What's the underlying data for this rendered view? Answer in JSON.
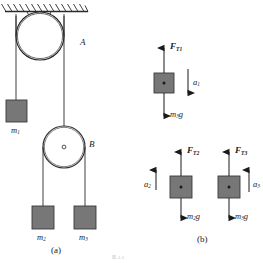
{
  "figure": {
    "panels": [
      {
        "key": "a",
        "caption": "(a)"
      },
      {
        "key": "b",
        "caption": "(b)"
      }
    ],
    "bottom_watermark": "图 4-4"
  },
  "panel_a": {
    "label_pulley_a": "A",
    "label_pulley_b": "B",
    "label_mass_1": "m",
    "label_mass_1_sub": "1",
    "label_mass_2": "m",
    "label_mass_2_sub": "2",
    "label_mass_3": "m",
    "label_mass_3_sub": "3",
    "caption": "(a)"
  },
  "panel_b": {
    "caption": "(b)",
    "bodies": [
      {
        "name": "fbd-m3-upper",
        "tension_symbol": "F",
        "tension_sub": "T1",
        "weight_symbol": "m",
        "weight_sub": "3",
        "weight_g": "g",
        "accel_symbol": "a",
        "accel_sub": "1",
        "accel_direction": "down"
      },
      {
        "name": "fbd-m2",
        "tension_symbol": "F",
        "tension_sub": "T2",
        "weight_symbol": "m",
        "weight_sub": "2",
        "weight_g": "g",
        "accel_symbol": "a",
        "accel_sub": "2",
        "accel_direction": "up"
      },
      {
        "name": "fbd-m3-lower",
        "tension_symbol": "F",
        "tension_sub": "T3",
        "weight_symbol": "m",
        "weight_sub": "3",
        "weight_g": "g",
        "accel_symbol": "a",
        "accel_sub": "3",
        "accel_direction": "up"
      }
    ]
  },
  "colors": {
    "block_fill": "#777777",
    "block_stroke": "#3a3a3a",
    "line": "#2b2b2b",
    "background": "#ffffff"
  }
}
